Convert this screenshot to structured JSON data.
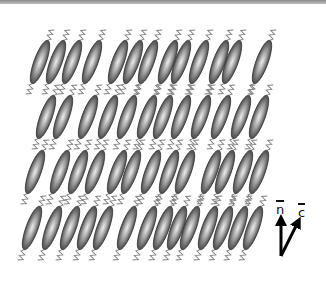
{
  "diagram": {
    "type": "smectic-C liquid crystal schematic",
    "tilt_deg": 20,
    "molecule": {
      "length": 46,
      "width": 12,
      "tail_length": 12
    },
    "colors": {
      "molecule_dark": "#4a4a4a",
      "molecule_light": "#e8e8e8",
      "outline": "#3a3a3a",
      "tail": "#808080",
      "arrow": "#000000",
      "topbar": "#9a9a9a"
    },
    "layers": [
      {
        "y": 62,
        "x": [
          40,
          56,
          72,
          92,
          118,
          133,
          148,
          168,
          181,
          199,
          219,
          232,
          262
        ]
      },
      {
        "y": 117,
        "x": [
          46,
          63,
          88,
          108,
          127,
          147,
          163,
          181,
          201,
          221,
          241,
          259
        ]
      },
      {
        "y": 172,
        "x": [
          35,
          60,
          78,
          95,
          117,
          131,
          151,
          169,
          185,
          211,
          225,
          243,
          259
        ]
      },
      {
        "y": 228,
        "x": [
          32,
          52,
          70,
          87,
          103,
          127,
          147,
          163,
          177,
          190,
          208,
          223,
          238,
          253
        ]
      }
    ]
  },
  "legend": {
    "n_label": "n",
    "c_label": "c",
    "origin": [
      281,
      256
    ],
    "n_tip": [
      281,
      220
    ],
    "c_tip": [
      298,
      222
    ]
  }
}
